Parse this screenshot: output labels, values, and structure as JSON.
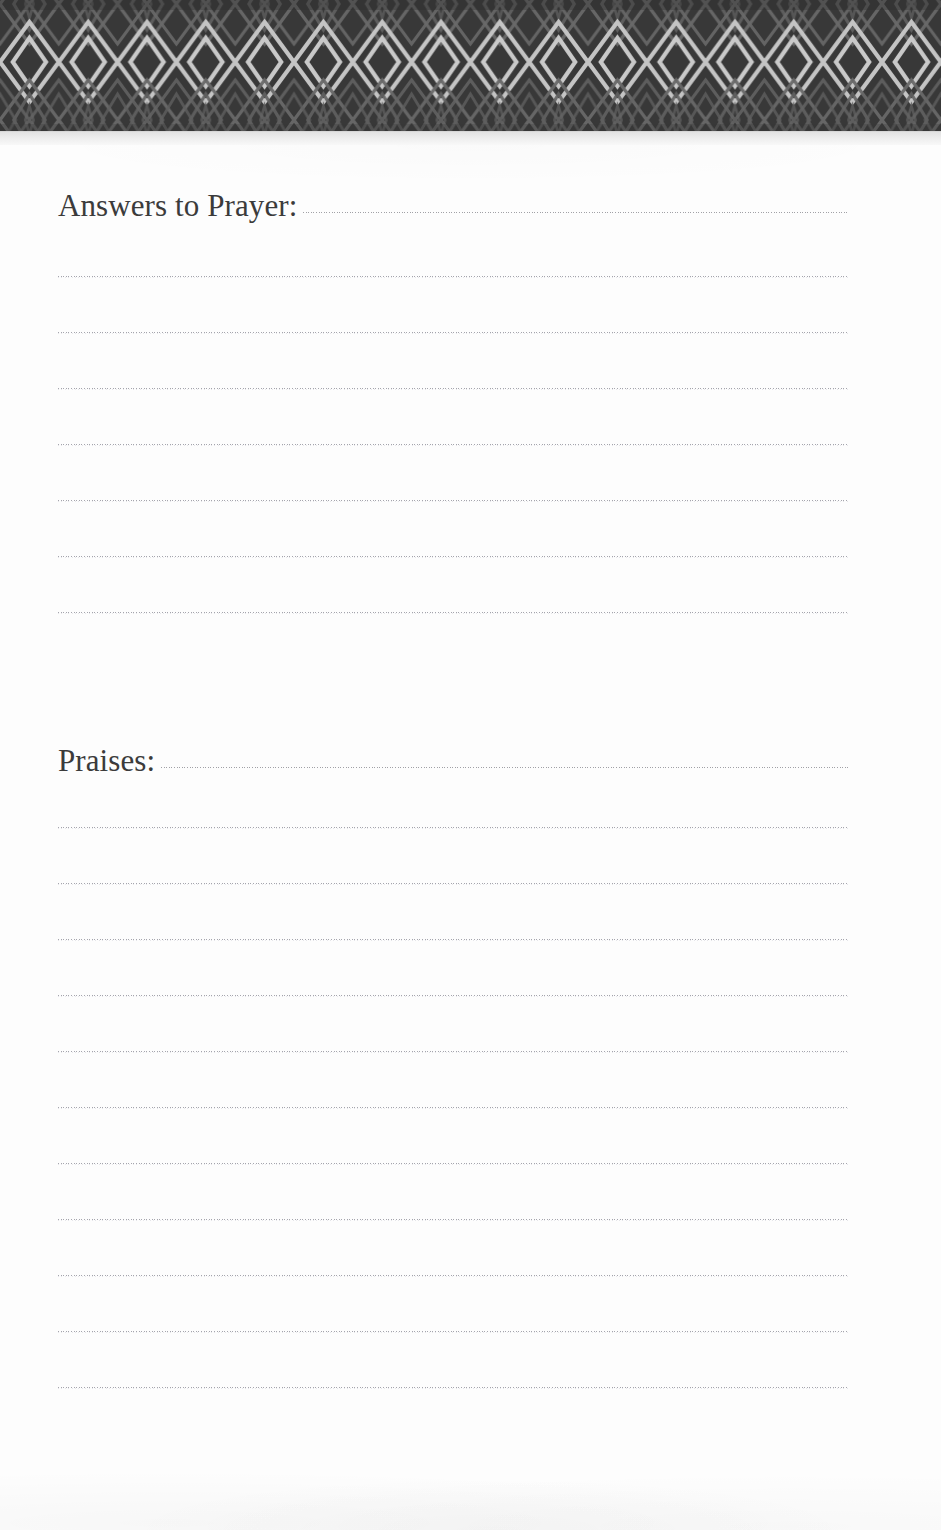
{
  "page": {
    "background_color": "#fdfdfd",
    "width": 941,
    "height": 1530
  },
  "header": {
    "name": "decorative-diamond-border",
    "pattern": "concentric-diamonds",
    "background_color": "#3c3c3c",
    "line_color": "#c8c8c8",
    "diamond_count": 16,
    "height": 132
  },
  "sections": [
    {
      "id": "answers-to-prayer",
      "heading": "Answers to Prayer:",
      "has_heading_rule": true,
      "line_count": 7,
      "line_spacing": 56,
      "first_line_offset": 140
    },
    {
      "id": "praises",
      "heading": "Praises:",
      "has_heading_rule": true,
      "line_count": 11,
      "line_spacing": 56,
      "first_line_offset": 106
    }
  ],
  "rule_style": {
    "color": "#90909a",
    "left": 58,
    "width": 790
  }
}
